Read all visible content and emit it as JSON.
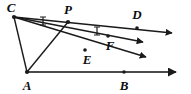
{
  "figure": {
    "stroke_color": "#1a1a1a",
    "background_color": "#ffffff",
    "labels": [
      {
        "id": "C",
        "text": "C",
        "x": 11,
        "y": 7,
        "size": 13
      },
      {
        "id": "P",
        "text": "P",
        "x": 68,
        "y": 9,
        "size": 13
      },
      {
        "id": "D",
        "text": "D",
        "x": 137,
        "y": 14,
        "size": 13
      },
      {
        "id": "F",
        "text": "F",
        "x": 110,
        "y": 45,
        "size": 13
      },
      {
        "id": "E",
        "text": "E",
        "x": 87,
        "y": 59,
        "size": 13
      },
      {
        "id": "A",
        "text": "A",
        "x": 27,
        "y": 85,
        "size": 13
      },
      {
        "id": "B",
        "text": "B",
        "x": 124,
        "y": 85,
        "size": 13
      }
    ],
    "vertices": [
      {
        "id": "C",
        "x": 14,
        "y": 17
      },
      {
        "id": "P",
        "x": 68,
        "y": 22
      },
      {
        "id": "A",
        "x": 27,
        "y": 72
      },
      {
        "id": "D",
        "x": 137,
        "y": 28
      },
      {
        "id": "F",
        "x": 108,
        "y": 36
      },
      {
        "id": "E",
        "x": 85,
        "y": 50
      },
      {
        "id": "B",
        "x": 124,
        "y": 72
      }
    ],
    "rays": [
      {
        "id": "ray-C-P-D",
        "from": "C",
        "through": "P",
        "to_x": 178,
        "to_y": 33,
        "label_endpoint": "D"
      },
      {
        "id": "ray-C-F",
        "from": "C",
        "through": "F",
        "to_x": 150,
        "to_y": 43,
        "label_endpoint": "F"
      },
      {
        "id": "ray-C-E",
        "from": "C",
        "through": "E",
        "to_x": 152,
        "to_y": 58,
        "label_endpoint": "E"
      },
      {
        "id": "ray-A-B",
        "from": "A",
        "through": "B",
        "to_x": 180,
        "to_y": 72,
        "label_endpoint": "B"
      }
    ],
    "segments": [
      {
        "id": "segment-C-A",
        "from": "C",
        "to": "A"
      },
      {
        "id": "segment-A-P",
        "from": "A",
        "to": "P"
      }
    ],
    "tick_marks": [
      {
        "id": "tick-on-CP",
        "x": 43,
        "y": 21
      },
      {
        "id": "tick-on-CF",
        "x": 97,
        "y": 31
      }
    ],
    "point_dots": [
      "C",
      "P",
      "A",
      "D",
      "F",
      "E",
      "B"
    ],
    "arrowheads": 4
  }
}
